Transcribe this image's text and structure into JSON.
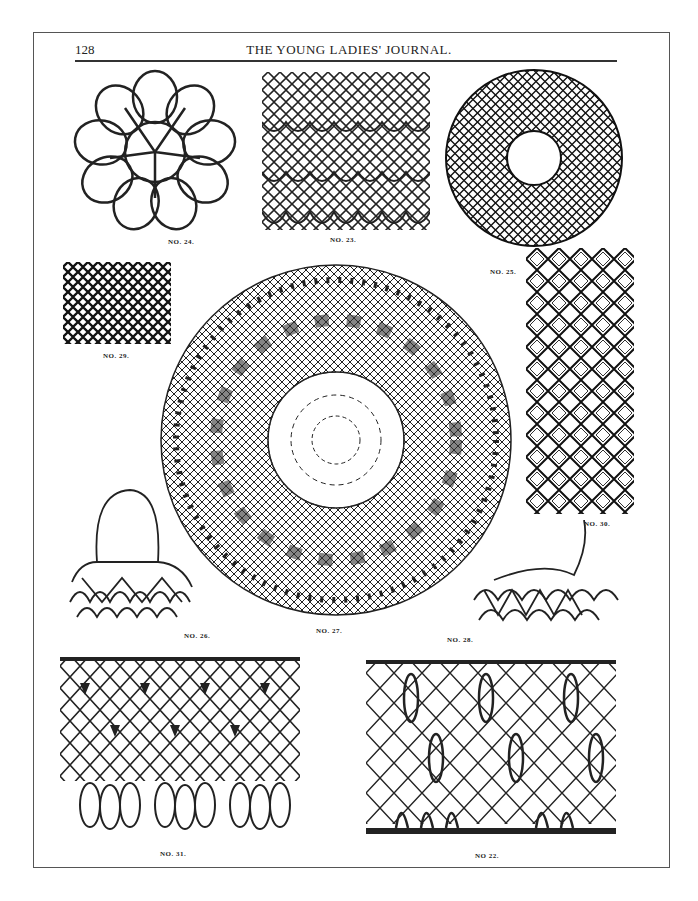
{
  "header": {
    "page_number": "128",
    "title": "THE YOUNG LADIES' JOURNAL."
  },
  "figures": [
    {
      "id": "24",
      "caption": "NO. 24."
    },
    {
      "id": "23",
      "caption": "NO. 23."
    },
    {
      "id": "25",
      "caption": "NO. 25."
    },
    {
      "id": "29",
      "caption": "NO. 29."
    },
    {
      "id": "27",
      "caption": "NO. 27."
    },
    {
      "id": "30",
      "caption": "NO. 30."
    },
    {
      "id": "26",
      "caption": "NO. 26."
    },
    {
      "id": "28",
      "caption": "NO. 28."
    },
    {
      "id": "31",
      "caption": "NO. 31."
    },
    {
      "id": "22",
      "caption": "NO 22."
    }
  ]
}
